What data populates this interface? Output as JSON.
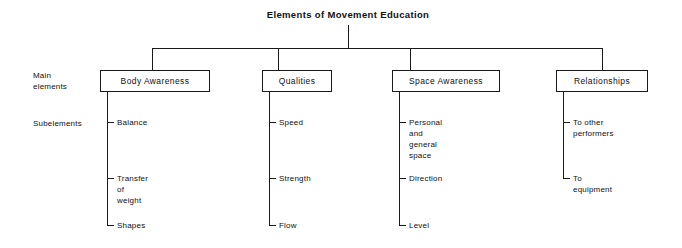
{
  "diagram": {
    "title": "Elements of Movement Education",
    "row_labels": {
      "main": "Main\nelements",
      "sub": "Subelements"
    },
    "line_color": "#1a1a1a",
    "background": "#ffffff",
    "branches": [
      {
        "label": "Body Awareness",
        "subelements": [
          {
            "label": "Balance"
          },
          {
            "label": "Transfer of\nweight"
          },
          {
            "label": "Shapes"
          }
        ]
      },
      {
        "label": "Qualities",
        "subelements": [
          {
            "label": "Speed"
          },
          {
            "label": "Strength"
          },
          {
            "label": "Flow"
          }
        ]
      },
      {
        "label": "Space Awareness",
        "subelements": [
          {
            "label": "Personal and\ngeneral space"
          },
          {
            "label": "Direction"
          },
          {
            "label": "Level"
          }
        ]
      },
      {
        "label": "Relationships",
        "subelements": [
          {
            "label": "To other\nperformers"
          },
          {
            "label": "To equipment"
          }
        ]
      }
    ]
  }
}
